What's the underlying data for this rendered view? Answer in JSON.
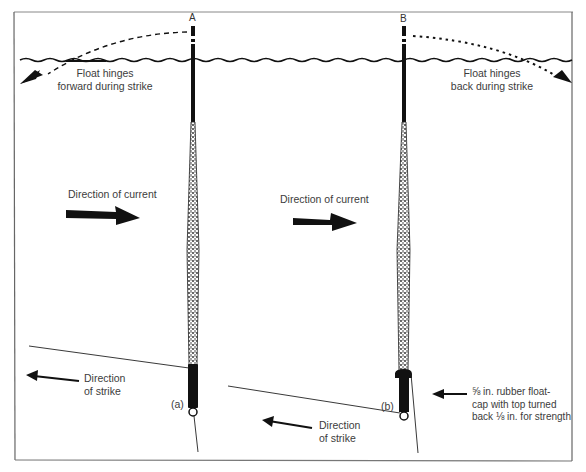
{
  "figure": {
    "float_a": {
      "letter": "A",
      "sub_label": "(a)",
      "hinge_label_line1": "Float hinges",
      "hinge_label_line2": "forward during strike",
      "current_label": "Direction of current",
      "strike_label_line1": "Direction",
      "strike_label_line2": "of strike"
    },
    "float_b": {
      "letter": "B",
      "sub_label": "(b)",
      "hinge_label_line1": "Float hinges",
      "hinge_label_line2": "back during strike",
      "current_label": "Direction of current",
      "strike_label_line1": "Direction",
      "strike_label_line2": "of strike",
      "cap_label_line1": "⅝ in. rubber float-",
      "cap_label_line2": "cap with top turned",
      "cap_label_line3": "back ⅛ in. for strength"
    },
    "colors": {
      "ink": "#111111",
      "text": "#3c3c3c",
      "frame": "#777777",
      "background": "#ffffff"
    }
  }
}
